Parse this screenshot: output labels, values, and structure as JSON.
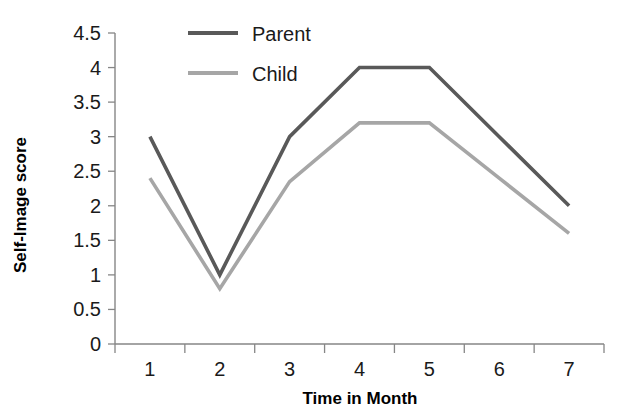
{
  "chart_data": {
    "type": "line",
    "title": "",
    "xlabel": "Time in Month",
    "ylabel": "Self-Image score",
    "categories": [
      "1",
      "2",
      "3",
      "4",
      "5",
      "6",
      "7"
    ],
    "x_tick_labels": [
      "1",
      "2",
      "3",
      "4",
      "5",
      "6",
      "7"
    ],
    "y_tick_labels": [
      "0",
      "0.5",
      "1",
      "1.5",
      "2",
      "2.5",
      "3",
      "3.5",
      "4",
      "4.5"
    ],
    "y_tick_values": [
      0,
      0.5,
      1,
      1.5,
      2,
      2.5,
      3,
      3.5,
      4,
      4.5
    ],
    "ylim": [
      0,
      4.5
    ],
    "grid": false,
    "legend_position": "top-center",
    "series": [
      {
        "name": "Parent",
        "color": "#595959",
        "values": [
          3.0,
          1.0,
          3.0,
          4.0,
          4.0,
          3.0,
          2.0
        ]
      },
      {
        "name": "Child",
        "color": "#a6a6a6",
        "values": [
          2.4,
          0.8,
          2.35,
          3.2,
          3.2,
          2.4,
          1.6
        ]
      }
    ]
  },
  "axes": {
    "x_title": "Time in Month",
    "y_title": "Self-Image score",
    "axis_color": "#868686"
  },
  "legend": {
    "items": [
      {
        "label": "Parent",
        "color": "#595959"
      },
      {
        "label": "Child",
        "color": "#a6a6a6"
      }
    ]
  },
  "ticks": {
    "y": [
      {
        "label": "4.5"
      },
      {
        "label": "4"
      },
      {
        "label": "3.5"
      },
      {
        "label": "3"
      },
      {
        "label": "2.5"
      },
      {
        "label": "2"
      },
      {
        "label": "1.5"
      },
      {
        "label": "1"
      },
      {
        "label": "0.5"
      },
      {
        "label": "0"
      }
    ],
    "x": [
      {
        "label": "1"
      },
      {
        "label": "2"
      },
      {
        "label": "3"
      },
      {
        "label": "4"
      },
      {
        "label": "5"
      },
      {
        "label": "6"
      },
      {
        "label": "7"
      }
    ]
  }
}
